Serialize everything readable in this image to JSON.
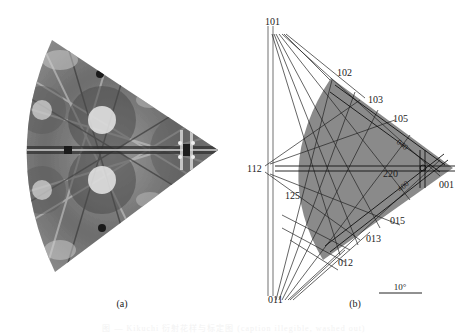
{
  "figure": {
    "panel_a": {
      "label": "(a)",
      "description": "Kikuchi pattern (grayscale photographic image), fan/triangle shaped"
    },
    "panel_b": {
      "label": "(b)",
      "pole_labels": {
        "p101": "101",
        "p102": "102",
        "p103": "103",
        "p105": "105",
        "p040": "040",
        "p220": "220",
        "p400": "400",
        "p001": "001",
        "p112": "112",
        "p125": "125",
        "p015": "015",
        "p013": "013",
        "p012": "012",
        "p011": "011"
      },
      "scale_bar": "10°",
      "colors": {
        "region_fill": "#8a8a8a",
        "lines": "#1a1a1a",
        "thin_lines": "#333333"
      }
    },
    "caption": "图 — Kikuchi 衍射花样与标定图 (caption illegible, washed out)"
  }
}
